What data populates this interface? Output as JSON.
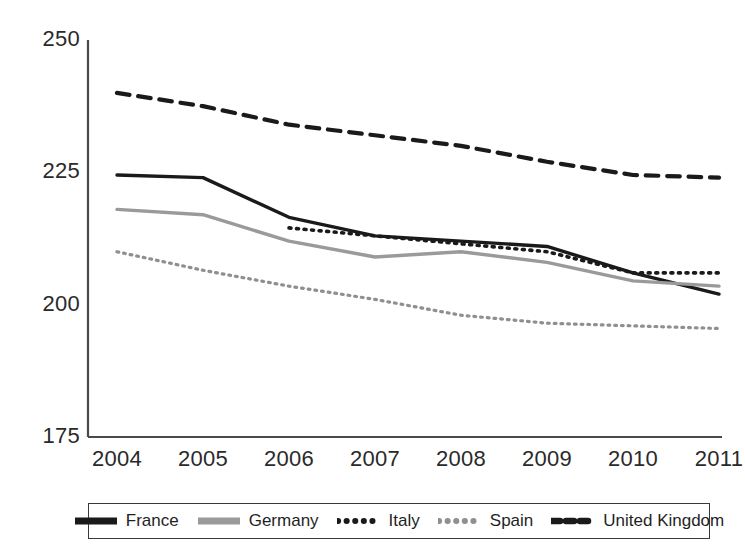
{
  "chart_data": {
    "type": "line",
    "title": "",
    "subtitle": "",
    "xlabel": "",
    "ylabel": "",
    "categories": [
      "2004",
      "2005",
      "2006",
      "2007",
      "2008",
      "2009",
      "2010",
      "2011"
    ],
    "x": [
      2004,
      2005,
      2006,
      2007,
      2008,
      2009,
      2010,
      2011
    ],
    "ylim": [
      175,
      250
    ],
    "yticks": [
      175,
      200,
      225,
      250
    ],
    "ytick_labels": [
      "175",
      "200",
      "225",
      "250"
    ],
    "xtick_labels": [
      "2004",
      "2005",
      "2006",
      "2007",
      "2008",
      "2009",
      "2010",
      "2011"
    ],
    "grid": false,
    "legend_position": "bottom",
    "series": [
      {
        "name": "France",
        "style": "solid",
        "color": "#1a1a1a",
        "width": 3.4,
        "values": [
          224.5,
          224.0,
          216.5,
          213.0,
          212.0,
          211.0,
          206.0,
          202.0
        ]
      },
      {
        "name": "Germany",
        "style": "solid",
        "color": "#9a9a9a",
        "width": 3.4,
        "values": [
          218.0,
          217.0,
          212.0,
          209.0,
          210.0,
          208.0,
          204.5,
          203.5
        ]
      },
      {
        "name": "Italy",
        "style": "dotted",
        "color": "#1a1a1a",
        "width": 3.6,
        "values": [
          null,
          null,
          214.5,
          213.0,
          211.5,
          210.0,
          206.0,
          206.0
        ]
      },
      {
        "name": "Spain",
        "style": "dotted",
        "color": "#8f8f8f",
        "width": 3.2,
        "values": [
          210.0,
          206.5,
          203.5,
          201.0,
          198.0,
          196.5,
          196.0,
          195.5
        ]
      },
      {
        "name": "United Kingdom",
        "style": "dashed",
        "color": "#1a1a1a",
        "width": 4.2,
        "values": [
          240.0,
          237.5,
          234.0,
          232.0,
          230.0,
          227.0,
          224.5,
          224.0
        ]
      }
    ]
  },
  "axes": {
    "y_ticks": [
      {
        "label": "250",
        "value": 250
      },
      {
        "label": "225",
        "value": 225
      },
      {
        "label": "200",
        "value": 200
      },
      {
        "label": "175",
        "value": 175
      }
    ],
    "x_ticks": [
      {
        "label": "2004"
      },
      {
        "label": "2005"
      },
      {
        "label": "2006"
      },
      {
        "label": "2007"
      },
      {
        "label": "2008"
      },
      {
        "label": "2009"
      },
      {
        "label": "2010"
      },
      {
        "label": "2011"
      }
    ]
  },
  "legend": {
    "entries": [
      {
        "label": "France",
        "style": "solid",
        "color": "#1a1a1a"
      },
      {
        "label": "Germany",
        "style": "solid",
        "color": "#9a9a9a"
      },
      {
        "label": "Italy",
        "style": "dotted",
        "color": "#1a1a1a"
      },
      {
        "label": "Spain",
        "style": "dotted",
        "color": "#8f8f8f"
      },
      {
        "label": "United Kingdom",
        "style": "dashed",
        "color": "#1a1a1a"
      }
    ]
  }
}
